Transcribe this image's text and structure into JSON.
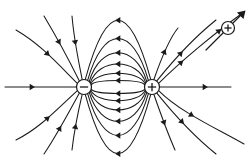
{
  "figure": {
    "background_color": "#ffffff",
    "line_color": "#1a1a1a",
    "width": 248,
    "height": 157
  },
  "charges": [
    {
      "id": "negative-charge",
      "sign": "−",
      "label": "negative point charge",
      "cx": 84,
      "cy": 87,
      "r": 7.5,
      "role": "sink"
    },
    {
      "id": "positive-charge",
      "sign": "+",
      "label": "positive point charge",
      "cx": 152,
      "cy": 87,
      "r": 7.5,
      "role": "source"
    }
  ],
  "test_charge": {
    "id": "test-charge",
    "sign": "+",
    "label": "positive test charge",
    "cx": 228,
    "cy": 28,
    "r": 6.5,
    "vector": {
      "label": "force direction on test charge",
      "from": [
        206,
        50
      ],
      "to": [
        244,
        12
      ]
    }
  },
  "chart_data": {
    "type": "line",
    "xlabel": "",
    "ylabel": "",
    "xlim": [
      0,
      248
    ],
    "ylim": [
      0,
      157
    ],
    "grid": false,
    "legend": "none",
    "annotations": [
      "Field lines originate on the positive charge and terminate on the negative charge.",
      "A positive test charge is drawn on the upper-right field line with a force arrow tangent to the line."
    ],
    "series": [
      {
        "name": "axis-line-left",
        "kind": "straight",
        "points": [
          [
            5,
            87
          ],
          [
            76,
            87
          ]
        ],
        "arrows": [
          {
            "at": [
              32,
              87
            ],
            "angle": 0
          }
        ],
        "direction": "into-negative"
      },
      {
        "name": "axis-line-right",
        "kind": "straight",
        "points": [
          [
            160,
            87
          ],
          [
            231,
            87
          ]
        ],
        "arrows": [
          {
            "at": [
              205,
              87
            ],
            "angle": 0
          }
        ],
        "direction": "out-of-positive"
      },
      {
        "name": "dipole-arc-1-upper",
        "kind": "arc",
        "apex": [
          118,
          22
        ],
        "direction": "positive-to-negative",
        "arrows": [
          {
            "at": [
              118,
              22
            ],
            "angle": 180
          }
        ]
      },
      {
        "name": "dipole-arc-2-upper",
        "kind": "arc",
        "apex": [
          118,
          40
        ],
        "direction": "positive-to-negative",
        "arrows": [
          {
            "at": [
              118,
              40
            ],
            "angle": 180
          }
        ]
      },
      {
        "name": "dipole-arc-3-upper",
        "kind": "arc",
        "apex": [
          118,
          54
        ],
        "direction": "positive-to-negative",
        "arrows": [
          {
            "at": [
              118,
              54
            ],
            "angle": 180
          }
        ]
      },
      {
        "name": "dipole-arc-4-upper",
        "kind": "arc",
        "apex": [
          118,
          65
        ],
        "direction": "positive-to-negative",
        "arrows": [
          {
            "at": [
              118,
              65
            ],
            "angle": 180
          }
        ]
      },
      {
        "name": "dipole-arc-5-upper",
        "kind": "arc",
        "apex": [
          118,
          74
        ],
        "direction": "positive-to-negative",
        "arrows": [
          {
            "at": [
              118,
              74
            ],
            "angle": 180
          }
        ]
      },
      {
        "name": "dipole-arc-6-upper",
        "kind": "arc",
        "apex": [
          118,
          81
        ],
        "direction": "positive-to-negative",
        "arrows": [
          {
            "at": [
              118,
              81
            ],
            "angle": 180
          }
        ]
      },
      {
        "name": "dipole-arc-1-lower",
        "kind": "arc",
        "apex": [
          118,
          152
        ],
        "direction": "positive-to-negative",
        "arrows": [
          {
            "at": [
              118,
              152
            ],
            "angle": 180
          }
        ]
      },
      {
        "name": "dipole-arc-2-lower",
        "kind": "arc",
        "apex": [
          118,
          134
        ],
        "direction": "positive-to-negative",
        "arrows": [
          {
            "at": [
              118,
              134
            ],
            "angle": 180
          }
        ]
      },
      {
        "name": "dipole-arc-3-lower",
        "kind": "arc",
        "apex": [
          118,
          120
        ],
        "direction": "positive-to-negative",
        "arrows": [
          {
            "at": [
              118,
              120
            ],
            "angle": 180
          }
        ]
      },
      {
        "name": "dipole-arc-4-lower",
        "kind": "arc",
        "apex": [
          118,
          109
        ],
        "direction": "positive-to-negative",
        "arrows": [
          {
            "at": [
              118,
              109
            ],
            "angle": 180
          }
        ]
      },
      {
        "name": "dipole-arc-5-lower",
        "kind": "arc",
        "apex": [
          118,
          100
        ],
        "direction": "positive-to-negative",
        "arrows": [
          {
            "at": [
              118,
              100
            ],
            "angle": 180
          }
        ]
      },
      {
        "name": "dipole-arc-6-lower",
        "kind": "arc",
        "apex": [
          118,
          93
        ],
        "direction": "positive-to-negative",
        "arrows": [
          {
            "at": [
              118,
              93
            ],
            "angle": 180
          }
        ]
      },
      {
        "name": "outer-line-upper-left-1",
        "kind": "curve",
        "direction": "into-negative",
        "arrow_count": 1
      },
      {
        "name": "outer-line-upper-left-2",
        "kind": "curve",
        "direction": "into-negative",
        "arrow_count": 1
      },
      {
        "name": "outer-line-upper-left-3",
        "kind": "curve",
        "direction": "into-negative",
        "arrow_count": 1
      },
      {
        "name": "outer-line-lower-left-1",
        "kind": "curve",
        "direction": "into-negative",
        "arrow_count": 1
      },
      {
        "name": "outer-line-lower-left-2",
        "kind": "curve",
        "direction": "into-negative",
        "arrow_count": 1
      },
      {
        "name": "outer-line-lower-left-3",
        "kind": "curve",
        "direction": "into-negative",
        "arrow_count": 1
      },
      {
        "name": "outer-line-upper-right-1",
        "kind": "curve",
        "direction": "out-of-positive",
        "arrow_count": 1
      },
      {
        "name": "outer-line-upper-right-2",
        "kind": "curve",
        "direction": "out-of-positive",
        "arrow_count": 1
      },
      {
        "name": "outer-line-upper-right-3",
        "kind": "curve",
        "direction": "out-of-positive",
        "arrow_count": 2
      },
      {
        "name": "outer-line-lower-right-1",
        "kind": "curve",
        "direction": "out-of-positive",
        "arrow_count": 1
      },
      {
        "name": "outer-line-lower-right-2",
        "kind": "curve",
        "direction": "out-of-positive",
        "arrow_count": 1
      },
      {
        "name": "outer-line-lower-right-3",
        "kind": "curve",
        "direction": "out-of-positive",
        "arrow_count": 1
      }
    ]
  }
}
